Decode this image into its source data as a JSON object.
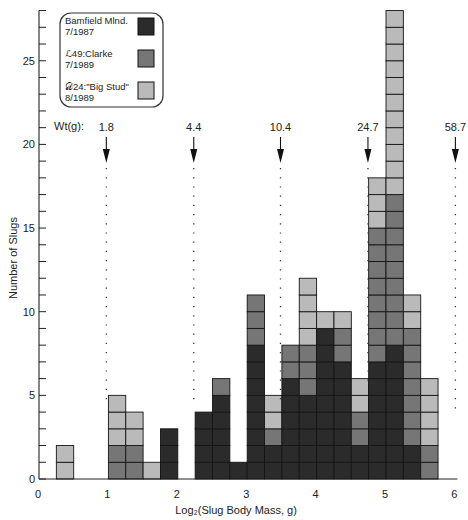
{
  "chart_data": {
    "type": "bar",
    "stacked": true,
    "title": "",
    "xlabel": "Log₂(Slug Body Mass, g)",
    "ylabel": "Number of Slugs",
    "xlim": [
      0,
      6
    ],
    "ylim": [
      0,
      28
    ],
    "grid": false,
    "x_ticks": [
      0,
      1,
      2,
      3,
      4,
      5,
      6
    ],
    "y_ticks": [
      0,
      5,
      10,
      15,
      20,
      25
    ],
    "y_minor_step": 1,
    "bin_width": 0.25,
    "bins": [
      0.25,
      1.0,
      1.25,
      1.5,
      1.75,
      2.25,
      2.5,
      2.75,
      3.0,
      3.25,
      3.5,
      3.75,
      4.0,
      4.25,
      4.5,
      4.75,
      5.0,
      5.25,
      5.5
    ],
    "series": [
      {
        "name": "Bamfield Mlnd. 7/1987",
        "color": "#2b2b2b",
        "values": [
          0,
          0,
          0,
          0,
          3,
          4,
          5,
          1,
          8,
          2,
          6,
          5,
          9,
          7,
          2,
          7,
          8,
          2,
          0
        ]
      },
      {
        "name": "ℒ49:Clarke 7/1989",
        "color": "#767676",
        "values": [
          0,
          2,
          2,
          0,
          0,
          0,
          1,
          0,
          3,
          1,
          2,
          3,
          0,
          2,
          2,
          8,
          9,
          7,
          2
        ]
      },
      {
        "name": "𝒟24:\"Big Stud\" 8/1989",
        "color": "#bababa",
        "values": [
          2,
          3,
          2,
          1,
          0,
          0,
          0,
          0,
          0,
          2,
          0,
          4,
          1,
          1,
          2,
          3,
          11,
          2,
          4
        ]
      }
    ],
    "totals": [
      2,
      5,
      4,
      1,
      3,
      4,
      6,
      1,
      11,
      5,
      8,
      12,
      10,
      10,
      6,
      18,
      28,
      11,
      6
    ],
    "legend": {
      "position": "upper-left",
      "entries": [
        {
          "line1": "Bamfield Mlnd.",
          "line2": "7/1987"
        },
        {
          "line1": "ℒ49:Clarke",
          "line2": "7/1989"
        },
        {
          "line1": "𝒟24:\"Big Stud\"",
          "line2": "8/1989"
        }
      ]
    },
    "annotations": {
      "label": "Wt(g):",
      "markers": [
        {
          "x": 0.97,
          "label": "1.8",
          "line_end_y": 4.5
        },
        {
          "x": 2.23,
          "label": "4.4",
          "line_end_y": 4.3
        },
        {
          "x": 3.48,
          "label": "10.4",
          "line_end_y": 4.75
        },
        {
          "x": 4.74,
          "label": "24.7",
          "line_end_y": 5.8
        },
        {
          "x": 6.0,
          "label": "58.7",
          "line_end_y": 4.1
        }
      ]
    }
  }
}
